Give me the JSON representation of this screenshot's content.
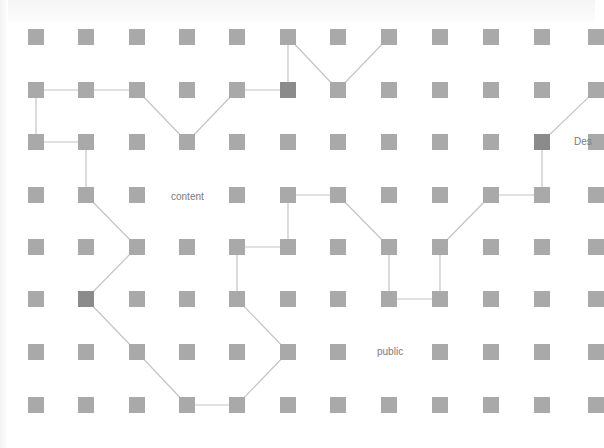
{
  "diagram": {
    "grid": {
      "columns_x": [
        36,
        86,
        137,
        187,
        237,
        288,
        338,
        389,
        440,
        491,
        542,
        596
      ],
      "rows_y": [
        37,
        90,
        142,
        195,
        247,
        299,
        352,
        405
      ],
      "node_size": 16
    },
    "colors": {
      "background": "#ffffff",
      "node": "#a9a9a9",
      "node_highlight": "#8b8b8b",
      "edge": "#c4c4c4",
      "label": "#7a7a7a"
    },
    "dark_nodes": [
      [
        5,
        1
      ],
      [
        1,
        5
      ],
      [
        10,
        2
      ]
    ],
    "hidden_nodes": [
      [
        3,
        3
      ],
      [
        7,
        6
      ]
    ],
    "labels": [
      {
        "id": "content",
        "text": "content",
        "x": 171,
        "y": 191
      },
      {
        "id": "public",
        "text": "public",
        "x": 377,
        "y": 346
      },
      {
        "id": "des",
        "text": "Des",
        "x": 574,
        "y": 136
      }
    ],
    "edges": [
      [
        [
          0,
          1
        ],
        [
          1,
          1
        ]
      ],
      [
        [
          1,
          1
        ],
        [
          2,
          1
        ]
      ],
      [
        [
          2,
          1
        ],
        [
          3,
          2
        ]
      ],
      [
        [
          3,
          2
        ],
        [
          4,
          1
        ]
      ],
      [
        [
          4,
          1
        ],
        [
          5,
          1
        ]
      ],
      [
        [
          5,
          1
        ],
        [
          5,
          0
        ]
      ],
      [
        [
          5,
          0
        ],
        [
          6,
          1
        ]
      ],
      [
        [
          6,
          1
        ],
        [
          7,
          0
        ]
      ],
      [
        [
          0,
          1
        ],
        [
          0,
          2
        ]
      ],
      [
        [
          0,
          2
        ],
        [
          1,
          2
        ]
      ],
      [
        [
          1,
          2
        ],
        [
          1,
          3
        ]
      ],
      [
        [
          1,
          3
        ],
        [
          2,
          4
        ]
      ],
      [
        [
          2,
          4
        ],
        [
          1,
          5
        ]
      ],
      [
        [
          1,
          5
        ],
        [
          2,
          6
        ]
      ],
      [
        [
          2,
          6
        ],
        [
          3,
          7
        ]
      ],
      [
        [
          3,
          7
        ],
        [
          4,
          7
        ]
      ],
      [
        [
          4,
          7
        ],
        [
          5,
          6
        ]
      ],
      [
        [
          5,
          6
        ],
        [
          4,
          5
        ]
      ],
      [
        [
          4,
          5
        ],
        [
          4,
          4
        ]
      ],
      [
        [
          4,
          4
        ],
        [
          5,
          4
        ]
      ],
      [
        [
          5,
          4
        ],
        [
          5,
          3
        ]
      ],
      [
        [
          5,
          3
        ],
        [
          6,
          3
        ]
      ],
      [
        [
          6,
          3
        ],
        [
          7,
          4
        ]
      ],
      [
        [
          7,
          4
        ],
        [
          7,
          5
        ]
      ],
      [
        [
          7,
          5
        ],
        [
          8,
          5
        ]
      ],
      [
        [
          8,
          5
        ],
        [
          8,
          4
        ]
      ],
      [
        [
          8,
          4
        ],
        [
          9,
          3
        ]
      ],
      [
        [
          9,
          3
        ],
        [
          10,
          3
        ]
      ],
      [
        [
          10,
          3
        ],
        [
          10,
          2
        ]
      ],
      [
        [
          10,
          2
        ],
        [
          11,
          1
        ]
      ]
    ]
  }
}
